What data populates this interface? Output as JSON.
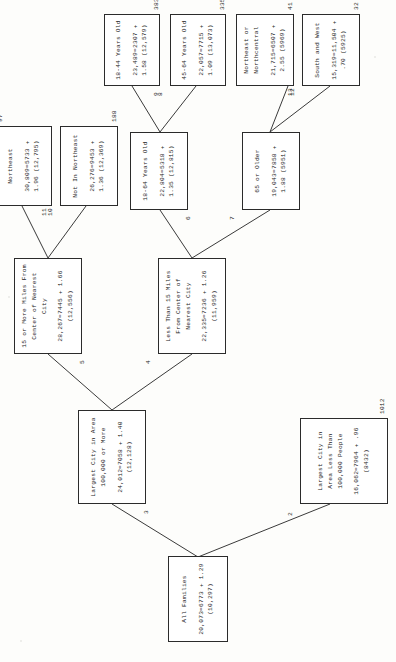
{
  "diagram": {
    "type": "tree",
    "orientation": "rotated-90",
    "nodes": [
      {
        "id": "1",
        "branch_label": "",
        "title": "All Families",
        "stat": "20,073=6773 + 1.29 (10,297)",
        "count": ""
      },
      {
        "id": "2",
        "branch_label": "2",
        "title": "Largest City in Area Less Than 100,000 People",
        "stat": "16,062=7964 + .96 (8432)",
        "count": "1012"
      },
      {
        "id": "3",
        "branch_label": "3",
        "title": "Largest City in Area 100,000  or More",
        "stat": "24,012=7058 + 1.40 (12,128)",
        "count": ""
      },
      {
        "id": "4",
        "branch_label": "4",
        "title": "Less Than 15 Miles From Center of Nearest City",
        "stat": "22,335=7236 + 1.26 (11,959)",
        "count": ""
      },
      {
        "id": "5",
        "branch_label": "5",
        "title": "15 or More Miles From Center of Nearest City",
        "stat": "28,267=7445 + 1.66 (12,556)",
        "count": ""
      },
      {
        "id": "6",
        "branch_label": "6",
        "title": "18-64 Years Old",
        "stat": "22,804=5318 + 1.35 (12,815)",
        "count": ""
      },
      {
        "id": "7",
        "branch_label": "7",
        "title": "65 or Older",
        "stat": "19,043=7858 + 1.88 (5951)",
        "count": ""
      },
      {
        "id": "8",
        "branch_label": "8",
        "title": "45-64 Years Old",
        "stat": "22,057=7715 + 1.09 (13,073)",
        "count": "335"
      },
      {
        "id": "9",
        "branch_label": "9",
        "title": "18-44 Years Old",
        "stat": "23,489=2307 + 1.58 (12,579)",
        "count": "383"
      },
      {
        "id": "10",
        "branch_label": "10",
        "title": "Not In Northeast",
        "stat": "26,276=9453 + 1.36 (12,369)",
        "count": "188"
      },
      {
        "id": "11",
        "branch_label": "11",
        "title": "Northeast",
        "stat": "30,809=5733 + 1.96 (12,795)",
        "count": "97"
      },
      {
        "id": "12",
        "branch_label": "12",
        "title": "South and West",
        "stat": "15,319=11,504 + .70 (5925)",
        "count": "32"
      },
      {
        "id": "13",
        "branch_label": "13",
        "title": "Northeast or Northcentral",
        "stat": "21,715=6507 + 2.55 (5969)",
        "count": "41"
      }
    ],
    "edges": [
      {
        "from": "1",
        "to": "2"
      },
      {
        "from": "1",
        "to": "3"
      },
      {
        "from": "3",
        "to": "4"
      },
      {
        "from": "3",
        "to": "5"
      },
      {
        "from": "5",
        "to": "10"
      },
      {
        "from": "5",
        "to": "11"
      },
      {
        "from": "4",
        "to": "6"
      },
      {
        "from": "4",
        "to": "7"
      },
      {
        "from": "6",
        "to": "8"
      },
      {
        "from": "6",
        "to": "9"
      },
      {
        "from": "7",
        "to": "12"
      },
      {
        "from": "7",
        "to": "13"
      }
    ],
    "colors": {
      "box_border": "#2b2b2b",
      "line": "#3a3a3a",
      "text": "#222222",
      "page": "#fdfdfb"
    }
  }
}
